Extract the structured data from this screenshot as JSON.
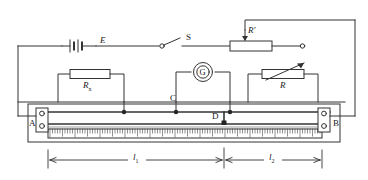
{
  "diagram": {
    "stroke_color": "#333333",
    "fill_color": "#ffffff",
    "background": "#ffffff"
  },
  "labels": {
    "battery": "E",
    "switch": "S",
    "rheostat_top": "R'",
    "resistor_unknown": "R",
    "resistor_unknown_sub": "x",
    "galvanometer": "G",
    "contact_c": "C",
    "contact_d": "D",
    "resistor_variable": "R",
    "terminal_a": "A",
    "terminal_b": "B",
    "length_1": "l",
    "length_1_sub": "1",
    "length_2": "l",
    "length_2_sub": "2"
  },
  "components": {
    "battery": {
      "name": "cell-E",
      "label": "E"
    },
    "switch": {
      "name": "switch-S",
      "label": "S",
      "state": "open"
    },
    "rheostat_top": {
      "name": "rheostat-R-prime",
      "label": "R'",
      "type": "potentiometer"
    },
    "resistor_rx": {
      "name": "resistor-Rx",
      "label": "Rx",
      "type": "fixed"
    },
    "galvanometer": {
      "name": "galvanometer-G",
      "label": "G",
      "type": "meter"
    },
    "resistor_r": {
      "name": "resistor-R",
      "label": "R",
      "type": "variable"
    },
    "slidewire": {
      "name": "slide-wire-AB",
      "terminals": [
        "A",
        "B"
      ],
      "slider": "D",
      "scale": "ruler"
    }
  },
  "dimensions": {
    "segment_left_label": "l1",
    "segment_right_label": "l2"
  }
}
